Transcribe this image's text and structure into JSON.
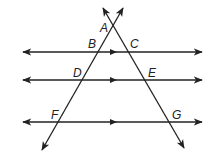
{
  "figure": {
    "colors": {
      "stroke": "#222222",
      "background": "#ffffff"
    },
    "points": {
      "A": {
        "label": "A",
        "x": 111,
        "y": 28
      },
      "B": {
        "label": "B",
        "x": 97,
        "y": 52
      },
      "C": {
        "label": "C",
        "x": 126,
        "y": 52
      },
      "D": {
        "label": "D",
        "x": 82,
        "y": 80
      },
      "E": {
        "label": "E",
        "x": 145,
        "y": 80
      },
      "F": {
        "label": "F",
        "x": 58,
        "y": 122
      },
      "G": {
        "label": "G",
        "x": 168,
        "y": 122
      }
    },
    "parallel_lines": [
      {
        "name": "line-BC",
        "y": 52,
        "x1": 23,
        "x2": 202,
        "through": [
          "B",
          "C"
        ]
      },
      {
        "name": "line-DE",
        "y": 80,
        "x1": 23,
        "x2": 202,
        "through": [
          "D",
          "E"
        ]
      },
      {
        "name": "line-FG",
        "y": 122,
        "x1": 23,
        "x2": 202,
        "through": [
          "F",
          "G"
        ]
      }
    ],
    "transversals": [
      {
        "name": "transversal-AF",
        "through": [
          "A",
          "B",
          "D",
          "F"
        ]
      },
      {
        "name": "transversal-AG",
        "through": [
          "A",
          "C",
          "E",
          "G"
        ]
      }
    ]
  }
}
